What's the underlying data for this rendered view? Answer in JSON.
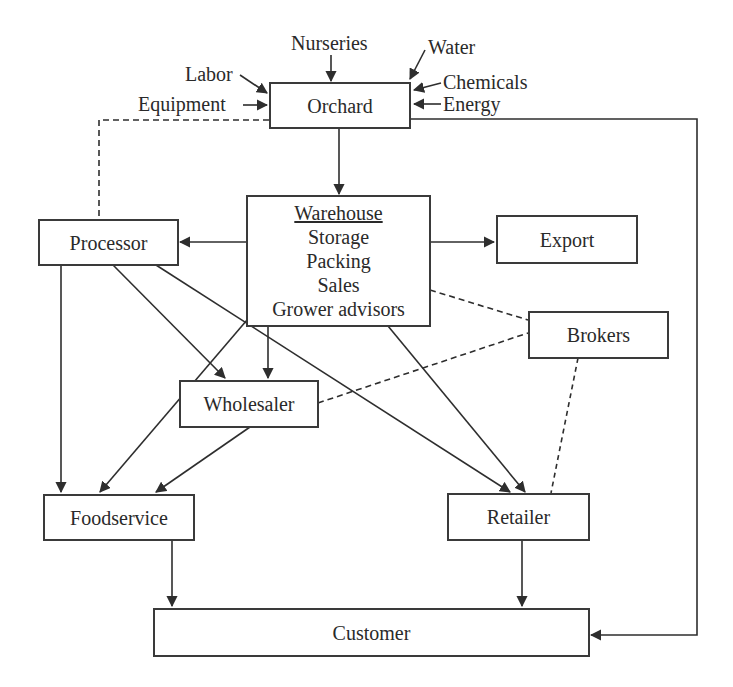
{
  "diagram": {
    "nodes": {
      "orchard": {
        "label": "Orchard"
      },
      "warehouse": {
        "title": "Warehouse",
        "lines": [
          "Storage",
          "Packing",
          "Sales",
          "Grower advisors"
        ]
      },
      "processor": {
        "label": "Processor"
      },
      "export": {
        "label": "Export"
      },
      "brokers": {
        "label": "Brokers"
      },
      "wholesaler": {
        "label": "Wholesaler"
      },
      "foodservice": {
        "label": "Foodservice"
      },
      "retailer": {
        "label": "Retailer"
      },
      "customer": {
        "label": "Customer"
      }
    },
    "inputs": {
      "nurseries": "Nurseries",
      "water": "Water",
      "labor": "Labor",
      "equipment": "Equipment",
      "chemicals": "Chemicals",
      "energy": "Energy"
    },
    "edges": [
      {
        "from": "Nurseries",
        "to": "Orchard",
        "style": "solid"
      },
      {
        "from": "Water",
        "to": "Orchard",
        "style": "solid"
      },
      {
        "from": "Labor",
        "to": "Orchard",
        "style": "solid"
      },
      {
        "from": "Equipment",
        "to": "Orchard",
        "style": "solid"
      },
      {
        "from": "Chemicals",
        "to": "Orchard",
        "style": "solid"
      },
      {
        "from": "Energy",
        "to": "Orchard",
        "style": "solid"
      },
      {
        "from": "Orchard",
        "to": "Warehouse",
        "style": "solid"
      },
      {
        "from": "Orchard",
        "to": "Processor",
        "style": "dashed"
      },
      {
        "from": "Orchard",
        "to": "Customer",
        "style": "solid"
      },
      {
        "from": "Warehouse",
        "to": "Processor",
        "style": "solid"
      },
      {
        "from": "Warehouse",
        "to": "Export",
        "style": "solid"
      },
      {
        "from": "Warehouse",
        "to": "Brokers",
        "style": "dashed"
      },
      {
        "from": "Warehouse",
        "to": "Wholesaler",
        "style": "solid"
      },
      {
        "from": "Warehouse",
        "to": "Foodservice",
        "style": "solid"
      },
      {
        "from": "Warehouse",
        "to": "Retailer",
        "style": "solid"
      },
      {
        "from": "Processor",
        "to": "Foodservice",
        "style": "solid"
      },
      {
        "from": "Processor",
        "to": "Wholesaler",
        "style": "solid"
      },
      {
        "from": "Processor",
        "to": "Retailer",
        "style": "solid"
      },
      {
        "from": "Wholesaler",
        "to": "Brokers",
        "style": "dashed"
      },
      {
        "from": "Wholesaler",
        "to": "Foodservice",
        "style": "solid"
      },
      {
        "from": "Brokers",
        "to": "Retailer",
        "style": "dashed"
      },
      {
        "from": "Foodservice",
        "to": "Customer",
        "style": "solid"
      },
      {
        "from": "Retailer",
        "to": "Customer",
        "style": "solid"
      }
    ],
    "colors": {
      "line": "#2e2e2e",
      "box_border": "#3a3a3a",
      "background": "#ffffff"
    }
  }
}
